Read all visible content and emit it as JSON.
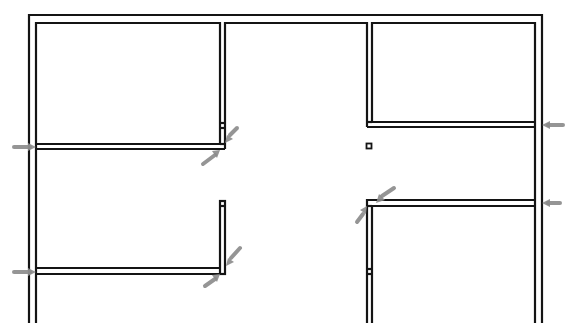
{
  "drawing": {
    "type": "floor-plan",
    "title": "",
    "colors": {
      "wall": "#141414",
      "marker": "#8a8a8a",
      "background": "#ffffff"
    },
    "rooms": [
      {
        "id": "room-top-left",
        "label": ""
      },
      {
        "id": "room-top-right",
        "label": ""
      },
      {
        "id": "room-bottom-left",
        "label": ""
      },
      {
        "id": "room-bottom-right",
        "label": ""
      },
      {
        "id": "corridor",
        "label": ""
      }
    ],
    "markers": [
      {
        "id": "section-marker-left-upper",
        "direction": "right"
      },
      {
        "id": "section-marker-left-lower",
        "direction": "right"
      },
      {
        "id": "section-marker-right-upper",
        "direction": "left"
      },
      {
        "id": "section-marker-right-lower",
        "direction": "left"
      },
      {
        "id": "diagonal-marker-upper-center",
        "direction": "diagonal"
      },
      {
        "id": "diagonal-marker-lower-center",
        "direction": "diagonal"
      },
      {
        "id": "diagonal-marker-right-center",
        "direction": "diagonal"
      }
    ],
    "column": {
      "id": "column-square"
    }
  }
}
